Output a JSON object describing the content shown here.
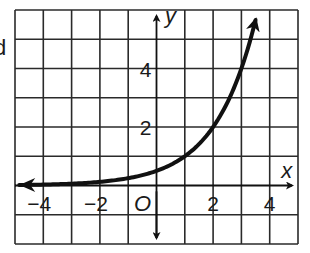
{
  "stray_text": "d",
  "chart_data": {
    "type": "line",
    "title": "",
    "xlabel": "x",
    "ylabel": "y",
    "origin_label": "O",
    "xlim": [
      -5,
      5
    ],
    "ylim": [
      -2,
      6
    ],
    "grid": true,
    "grid_step": 1,
    "x_ticks": [
      {
        "value": -4,
        "label": "−4"
      },
      {
        "value": -2,
        "label": "−2"
      },
      {
        "value": 2,
        "label": "2"
      },
      {
        "value": 4,
        "label": "4"
      }
    ],
    "y_ticks": [
      {
        "value": 2,
        "label": "2"
      },
      {
        "value": 4,
        "label": "4"
      }
    ],
    "series": [
      {
        "name": "curve",
        "function": "0.5 * 2^x",
        "x_domain": [
          -4.85,
          3.5
        ],
        "points": [
          {
            "x": -4,
            "y": 0.03
          },
          {
            "x": -2,
            "y": 0.125
          },
          {
            "x": 0,
            "y": 0.5
          },
          {
            "x": 1,
            "y": 1
          },
          {
            "x": 2,
            "y": 2
          },
          {
            "x": 3,
            "y": 4
          },
          {
            "x": 3.5,
            "y": 5.66
          }
        ],
        "arrows": [
          "left",
          "up"
        ],
        "color": "#111111"
      }
    ]
  }
}
